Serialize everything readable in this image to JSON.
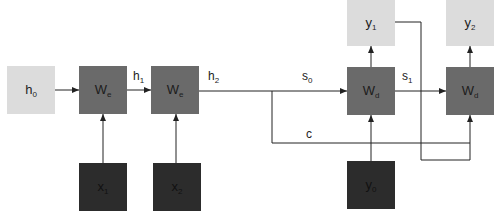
{
  "diagram": {
    "type": "seq2seq-encoder-decoder",
    "colors": {
      "state_node": "#dcdcdc",
      "weight_node": "#6a6a6a",
      "input_node": "#2c2c2c",
      "edge": "#222222"
    },
    "nodes": {
      "h0": {
        "base": "h",
        "sub": "0",
        "x": 7,
        "y": 66,
        "style": "light"
      },
      "we1": {
        "base": "W",
        "sub": "e",
        "x": 79,
        "y": 66,
        "style": "medium"
      },
      "we2": {
        "base": "W",
        "sub": "e",
        "x": 151,
        "y": 66,
        "style": "medium"
      },
      "x1": {
        "base": "x",
        "sub": "1",
        "x": 79,
        "y": 163,
        "style": "dark"
      },
      "x2": {
        "base": "x",
        "sub": "2",
        "x": 153,
        "y": 163,
        "style": "dark"
      },
      "wd1": {
        "base": "W",
        "sub": "d",
        "x": 347,
        "y": 67,
        "style": "medium"
      },
      "wd2": {
        "base": "W",
        "sub": "d",
        "x": 446,
        "y": 67,
        "style": "medium"
      },
      "y0": {
        "base": "y",
        "sub": "0",
        "x": 347,
        "y": 161,
        "style": "dark"
      },
      "y1": {
        "base": "y",
        "sub": "1",
        "x": 347,
        "y": 0,
        "style": "light"
      },
      "y2": {
        "base": "y",
        "sub": "2",
        "x": 446,
        "y": 0,
        "style": "light"
      }
    },
    "edge_labels": {
      "h1": {
        "base": "h",
        "sub": "1",
        "x": 133,
        "y": 69
      },
      "h2": {
        "base": "h",
        "sub": "2",
        "x": 208,
        "y": 69
      },
      "s0": {
        "base": "s",
        "sub": "0",
        "x": 302,
        "y": 69
      },
      "s1": {
        "base": "s",
        "sub": "1",
        "x": 402,
        "y": 69
      },
      "c": {
        "base": "c",
        "sub": "",
        "x": 306,
        "y": 127
      }
    },
    "edges": [
      {
        "from": "h0",
        "to": "we1"
      },
      {
        "from": "we1",
        "to": "we2",
        "label": "h1"
      },
      {
        "from": "x1",
        "to": "we1"
      },
      {
        "from": "x2",
        "to": "we2"
      },
      {
        "from": "we2",
        "to": "wd1",
        "label": "h2 / s0"
      },
      {
        "from": "we2",
        "to": "wd2",
        "label": "c"
      },
      {
        "from": "y0",
        "to": "wd1"
      },
      {
        "from": "wd1",
        "to": "y1"
      },
      {
        "from": "wd1",
        "to": "wd2",
        "label": "s1"
      },
      {
        "from": "y1",
        "to": "wd2"
      },
      {
        "from": "wd2",
        "to": "y2"
      }
    ]
  }
}
